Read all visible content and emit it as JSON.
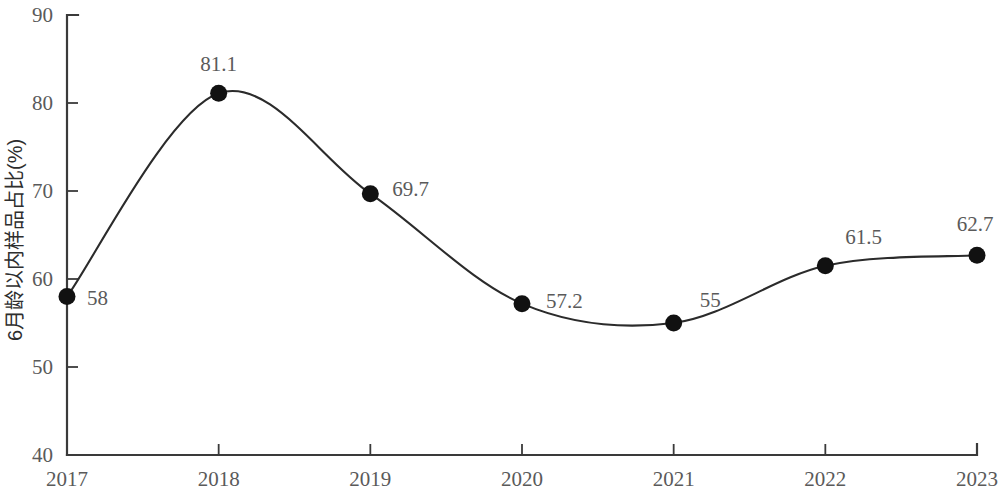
{
  "chart_data": {
    "type": "line",
    "title": "",
    "subtitle": "",
    "xlabel": "",
    "ylabel": "6月龄以内样品占比(%)",
    "categories": [
      "2017",
      "2018",
      "2019",
      "2020",
      "2021",
      "2022",
      "2023"
    ],
    "x": [
      2017,
      2018,
      2019,
      2020,
      2021,
      2022,
      2023
    ],
    "values": [
      58,
      81.1,
      69.7,
      57.2,
      55,
      61.5,
      62.7
    ],
    "point_labels": [
      "58",
      "81.1",
      "69.7",
      "57.2",
      "55",
      "61.5",
      "62.7"
    ],
    "series": [
      {
        "name": "6月龄以内样品占比(%)",
        "values": [
          58,
          81.1,
          69.7,
          57.2,
          55,
          61.5,
          62.7
        ]
      }
    ],
    "ylim": [
      40,
      90
    ],
    "y_ticks": [
      40,
      50,
      60,
      70,
      80,
      90
    ],
    "y_tick_labels": [
      "40",
      "50",
      "60",
      "70",
      "80",
      "90"
    ],
    "x_tick_labels": [
      "2017",
      "2018",
      "2019",
      "2020",
      "2021",
      "2022",
      "2023"
    ],
    "grid": false,
    "legend": false,
    "legend_position": "none",
    "smoothing": "spline",
    "marker": "filled-circle",
    "colors": {
      "line": "#2b2b2b",
      "marker": "#111111",
      "axis": "#3a3a3a",
      "label_text": "#5a5a5a",
      "axis_title": "#2e2e2e",
      "background": "#ffffff"
    },
    "label_offsets": [
      {
        "dx": 20,
        "dy": 8
      },
      {
        "dx": 0,
        "dy": -22
      },
      {
        "dx": 22,
        "dy": 2
      },
      {
        "dx": 24,
        "dy": 4
      },
      {
        "dx": 26,
        "dy": -16
      },
      {
        "dx": 20,
        "dy": -22
      },
      {
        "dx": -2,
        "dy": -24
      }
    ]
  }
}
